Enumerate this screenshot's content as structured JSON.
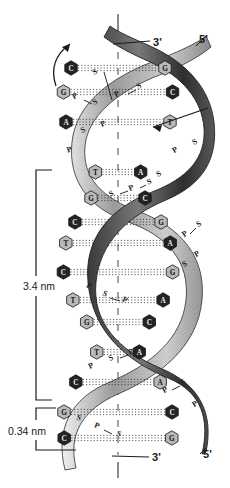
{
  "figure": {
    "type": "dna-double-helix-diagram",
    "background_color": "#ffffff",
    "ink_color": "#1a1a1a"
  },
  "measurements": [
    {
      "id": "helix-turn",
      "label": "3.4 nm",
      "meaning": "length of one complete helical turn",
      "bracket_top_y": 170,
      "bracket_bottom_y": 400
    },
    {
      "id": "base-rise",
      "label": "0.34 nm",
      "meaning": "distance between adjacent base pairs",
      "bracket_top_y": 408,
      "bracket_bottom_y": 450
    }
  ],
  "end_labels": {
    "top_left": "3'",
    "top_right": "5'",
    "bottom_left": "3'",
    "bottom_right": "5'"
  },
  "backbone_units": {
    "sugar": "S",
    "phosphate": "P",
    "separator": "—"
  },
  "strand_arrows": [
    {
      "id": "left-arrow",
      "direction": "up",
      "meaning": "strand runs 5' to 3' upward"
    },
    {
      "id": "right-arrow",
      "direction": "down-left",
      "meaning": "antiparallel strand runs downward"
    }
  ],
  "base_pairs": [
    {
      "row": 1,
      "y": 68,
      "left": "C",
      "right": "G",
      "left_fill": "dark",
      "right_fill": "light"
    },
    {
      "row": 2,
      "y": 92,
      "left": "G",
      "right": "C",
      "left_fill": "light",
      "right_fill": "dark"
    },
    {
      "row": 3,
      "y": 122,
      "left": "A",
      "right": "T",
      "left_fill": "dark",
      "right_fill": "light"
    },
    {
      "row": 4,
      "y": 172,
      "left": "T",
      "right": "A",
      "left_fill": "light",
      "right_fill": "dark"
    },
    {
      "row": 5,
      "y": 198,
      "left": "G",
      "right": "C",
      "left_fill": "light",
      "right_fill": "dark"
    },
    {
      "row": 6,
      "y": 222,
      "left": "C",
      "right": "G",
      "left_fill": "dark",
      "right_fill": "light"
    },
    {
      "row": 7,
      "y": 243,
      "left": "T",
      "right": "A",
      "left_fill": "light",
      "right_fill": "dark"
    },
    {
      "row": 8,
      "y": 272,
      "left": "C",
      "right": "G",
      "left_fill": "dark",
      "right_fill": "light"
    },
    {
      "row": 9,
      "y": 300,
      "left": "T",
      "right": "A",
      "left_fill": "light",
      "right_fill": "dark"
    },
    {
      "row": 10,
      "y": 322,
      "left": "G",
      "right": "C",
      "left_fill": "light",
      "right_fill": "dark"
    },
    {
      "row": 11,
      "y": 352,
      "left": "T",
      "right": "A",
      "left_fill": "light",
      "right_fill": "dark"
    },
    {
      "row": 12,
      "y": 382,
      "left": "C",
      "right": "A",
      "left_fill": "dark",
      "right_fill": "light"
    },
    {
      "row": 13,
      "y": 412,
      "left": "G",
      "right": "C",
      "left_fill": "light",
      "right_fill": "dark"
    },
    {
      "row": 14,
      "y": 438,
      "left": "C",
      "right": "G",
      "left_fill": "dark",
      "right_fill": "light"
    }
  ],
  "axis": {
    "id": "central-axis",
    "style": "dashed-vertical",
    "x": 118
  },
  "hydrogen_bonds": {
    "style": "dotted-horizontal",
    "lines_per_pair": 3
  }
}
